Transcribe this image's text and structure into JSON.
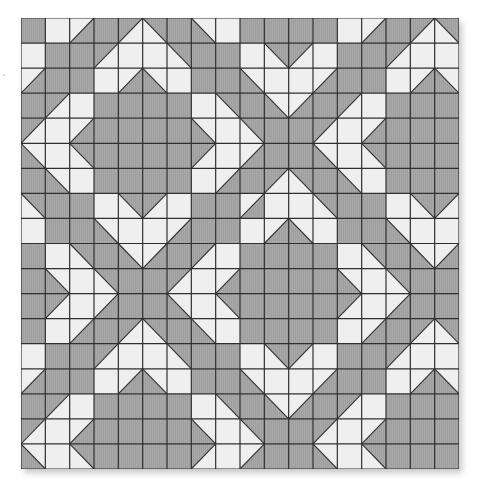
{
  "quilt": {
    "rows": 18,
    "cols": 18,
    "colors": {
      "gray": "#a8a8a8",
      "white": "#efefef",
      "line": "#2f2f2f"
    },
    "legend": {
      "G": "solid gray",
      "W": "solid white",
      "/g": "diagonal bottom-left to top-right, upper-left gray",
      "/w": "diagonal bottom-left to top-right, lower-right gray",
      "\\g": "diagonal top-left to bottom-right, upper-right gray",
      "\\w": "diagonal top-left to bottom-right, lower-left gray"
    },
    "grid": [
      [
        "G",
        "W",
        "/w",
        "G",
        "/g",
        "\\g",
        "G",
        "\\w",
        "W",
        "G",
        "G",
        "G",
        "G",
        "W",
        "/w",
        "G",
        "/g",
        "\\g"
      ],
      [
        "W",
        "G",
        "G",
        "/g",
        "W",
        "W",
        "\\g",
        "G",
        "G",
        "W",
        "\\g",
        "/g",
        "W",
        "G",
        "G",
        "/g",
        "W",
        "W"
      ],
      [
        "/w",
        "G",
        "G",
        "W",
        "/w",
        "\\w",
        "W",
        "G",
        "G",
        "\\w",
        "W",
        "W",
        "/w",
        "G",
        "G",
        "W",
        "/w",
        "\\w"
      ],
      [
        "G",
        "/g",
        "W",
        "G",
        "G",
        "G",
        "G",
        "W",
        "\\g",
        "G",
        "\\w",
        "/w",
        "G",
        "/g",
        "W",
        "G",
        "G",
        "G"
      ],
      [
        "/g",
        "W",
        "/w",
        "G",
        "G",
        "G",
        "G",
        "\\w",
        "W",
        "\\g",
        "G",
        "G",
        "/g",
        "W",
        "/w",
        "G",
        "G",
        "G"
      ],
      [
        "\\w",
        "W",
        "\\g",
        "G",
        "G",
        "G",
        "G",
        "/g",
        "W",
        "/w",
        "G",
        "G",
        "\\w",
        "W",
        "\\g",
        "G",
        "G",
        "G"
      ],
      [
        "G",
        "\\w",
        "W",
        "G",
        "G",
        "G",
        "G",
        "W",
        "/w",
        "G",
        "/g",
        "\\g",
        "G",
        "\\w",
        "W",
        "G",
        "G",
        "G"
      ],
      [
        "\\g",
        "G",
        "G",
        "W",
        "\\g",
        "/g",
        "W",
        "G",
        "G",
        "/w",
        "W",
        "W",
        "\\g",
        "G",
        "G",
        "W",
        "\\g",
        "/g"
      ],
      [
        "W",
        "G",
        "G",
        "\\w",
        "W",
        "W",
        "/w",
        "G",
        "G",
        "W",
        "/w",
        "\\w",
        "W",
        "G",
        "G",
        "\\w",
        "W",
        "W"
      ],
      [
        "G",
        "W",
        "\\g",
        "G",
        "\\w",
        "/w",
        "G",
        "/g",
        "W",
        "G",
        "G",
        "G",
        "G",
        "W",
        "\\g",
        "G",
        "\\w",
        "/w"
      ],
      [
        "G",
        "\\w",
        "W",
        "\\g",
        "G",
        "G",
        "/g",
        "W",
        "/w",
        "G",
        "G",
        "G",
        "G",
        "\\w",
        "W",
        "\\g",
        "G",
        "G"
      ],
      [
        "G",
        "/g",
        "W",
        "/w",
        "G",
        "G",
        "\\w",
        "W",
        "\\g",
        "G",
        "G",
        "G",
        "G",
        "/g",
        "W",
        "/w",
        "G",
        "G"
      ],
      [
        "G",
        "W",
        "/w",
        "G",
        "/g",
        "\\g",
        "G",
        "\\w",
        "W",
        "G",
        "G",
        "G",
        "G",
        "W",
        "/w",
        "G",
        "/g",
        "\\g"
      ],
      [
        "W",
        "G",
        "G",
        "/g",
        "W",
        "W",
        "\\g",
        "G",
        "G",
        "W",
        "\\g",
        "/g",
        "W",
        "G",
        "G",
        "/g",
        "W",
        "W"
      ],
      [
        "/w",
        "G",
        "G",
        "W",
        "/w",
        "\\w",
        "W",
        "G",
        "G",
        "\\w",
        "W",
        "W",
        "/w",
        "G",
        "G",
        "W",
        "/w",
        "\\w"
      ],
      [
        "G",
        "/g",
        "W",
        "G",
        "G",
        "G",
        "G",
        "W",
        "\\g",
        "G",
        "\\w",
        "/w",
        "G",
        "/g",
        "W",
        "G",
        "G",
        "G"
      ],
      [
        "/g",
        "W",
        "/w",
        "G",
        "G",
        "G",
        "G",
        "\\w",
        "W",
        "\\g",
        "G",
        "G",
        "/g",
        "W",
        "/w",
        "G",
        "G",
        "G"
      ],
      [
        "\\w",
        "W",
        "\\g",
        "G",
        "G",
        "G",
        "G",
        "/g",
        "W",
        "/w",
        "G",
        "G",
        "\\w",
        "W",
        "\\g",
        "G",
        "G",
        "G"
      ]
    ]
  }
}
